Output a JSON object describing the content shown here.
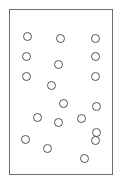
{
  "figure": {
    "type": "dot-diagram",
    "title": "",
    "background_color": "#ffffff",
    "canvas": {
      "width": 122,
      "height": 187
    },
    "frame": {
      "name": "plot-frame",
      "x": 9,
      "y": 9,
      "width": 104,
      "height": 166,
      "border_color": "#6e6e6e",
      "border_width": 1,
      "fill_color": "#ffffff"
    },
    "marker_style": {
      "shape": "circle",
      "outline_color": "#555555",
      "fill_color": "none",
      "stroke_width": 1,
      "diameter": 9
    },
    "dot_count": 19
  },
  "chart_data": {
    "type": "scatter",
    "title": "",
    "xlabel": "",
    "ylabel": "",
    "grid": false,
    "legend": null,
    "xlim": [
      9,
      113
    ],
    "ylim": [
      9,
      175
    ],
    "series": [
      {
        "name": "points",
        "marker": "open-circle",
        "color": "#555555",
        "points": [
          {
            "x": 27,
            "y": 36
          },
          {
            "x": 60,
            "y": 38
          },
          {
            "x": 95,
            "y": 38
          },
          {
            "x": 26,
            "y": 56
          },
          {
            "x": 95,
            "y": 56
          },
          {
            "x": 58,
            "y": 64
          },
          {
            "x": 26,
            "y": 76
          },
          {
            "x": 95,
            "y": 76
          },
          {
            "x": 51,
            "y": 85
          },
          {
            "x": 63,
            "y": 103
          },
          {
            "x": 96,
            "y": 106
          },
          {
            "x": 37,
            "y": 117
          },
          {
            "x": 81,
            "y": 118
          },
          {
            "x": 58,
            "y": 122
          },
          {
            "x": 25,
            "y": 139
          },
          {
            "x": 95,
            "y": 140
          },
          {
            "x": 47,
            "y": 148
          },
          {
            "x": 84,
            "y": 158
          },
          {
            "x": 96,
            "y": 132
          }
        ]
      }
    ]
  }
}
